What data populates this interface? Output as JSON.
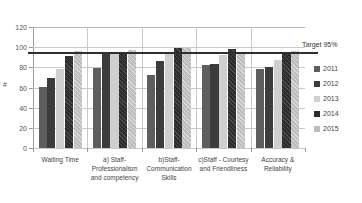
{
  "chart_data": {
    "type": "bar",
    "title": "",
    "subtitle": "",
    "xlabel": "",
    "ylabel": "#",
    "ylim": [
      0,
      120
    ],
    "ytick_labels": [
      "0",
      "20",
      "40",
      "60",
      "80",
      "100",
      "120"
    ],
    "ytick_values": [
      0,
      20,
      40,
      60,
      80,
      100,
      120
    ],
    "grid": true,
    "legend_position": "right",
    "categories": [
      "Waiting Time",
      "a) Staff-Professionalism and competency",
      "b)Staff-Communication Skills",
      "c)Staff - Courtesy and Friendliness",
      "Accuracy & Reliability"
    ],
    "series": [
      {
        "name": "2011",
        "color": "#5e5e5e",
        "values": [
          61,
          79,
          72,
          82,
          78
        ]
      },
      {
        "name": "2012",
        "color": "#3c3c3c",
        "values": [
          69,
          94,
          86,
          83,
          80
        ]
      },
      {
        "name": "2013",
        "color": "#cfcfcf",
        "values": [
          78,
          95,
          94,
          92,
          87
        ]
      },
      {
        "name": "2014",
        "color": "#2b2b2b",
        "values": [
          91,
          95,
          99,
          98,
          95
        ]
      },
      {
        "name": "2015",
        "color": "#bdbdbd",
        "values": [
          96,
          97,
          99,
          95,
          96
        ]
      }
    ],
    "annotations": [
      {
        "name": "target-line",
        "label": "Target 95%",
        "value": 95,
        "color": "#2f2f2f"
      }
    ]
  },
  "legend": {
    "items": [
      {
        "label": "2011"
      },
      {
        "label": "2012"
      },
      {
        "label": "2013"
      },
      {
        "label": "2014"
      },
      {
        "label": "2015"
      }
    ]
  }
}
